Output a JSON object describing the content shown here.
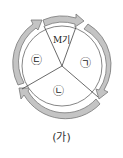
{
  "diagram": {
    "caption": "(가)",
    "sectors": [
      {
        "id": "M",
        "label": "M기"
      },
      {
        "id": "a",
        "label": "㉠"
      },
      {
        "id": "b",
        "label": "㉡"
      },
      {
        "id": "c",
        "label": "㉢"
      }
    ],
    "colors": {
      "ring": "#b8b8b8",
      "ring_stroke": "#7a7a7a",
      "line": "#444444"
    }
  }
}
